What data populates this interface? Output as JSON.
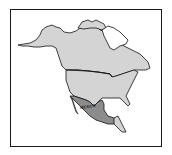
{
  "map": {
    "title": "North America",
    "highlighted_region": {
      "name": "Mexico",
      "label": "MEXICO",
      "fill": "#8c8c8c"
    },
    "land_fill": "#d4d4d4",
    "water_fill": "#ffffff",
    "outline_color": "#111111",
    "frame_color": "#1a1a1a",
    "regions": [
      "Alaska",
      "Canada",
      "Greenland",
      "United States",
      "Mexico",
      "Central America"
    ]
  }
}
